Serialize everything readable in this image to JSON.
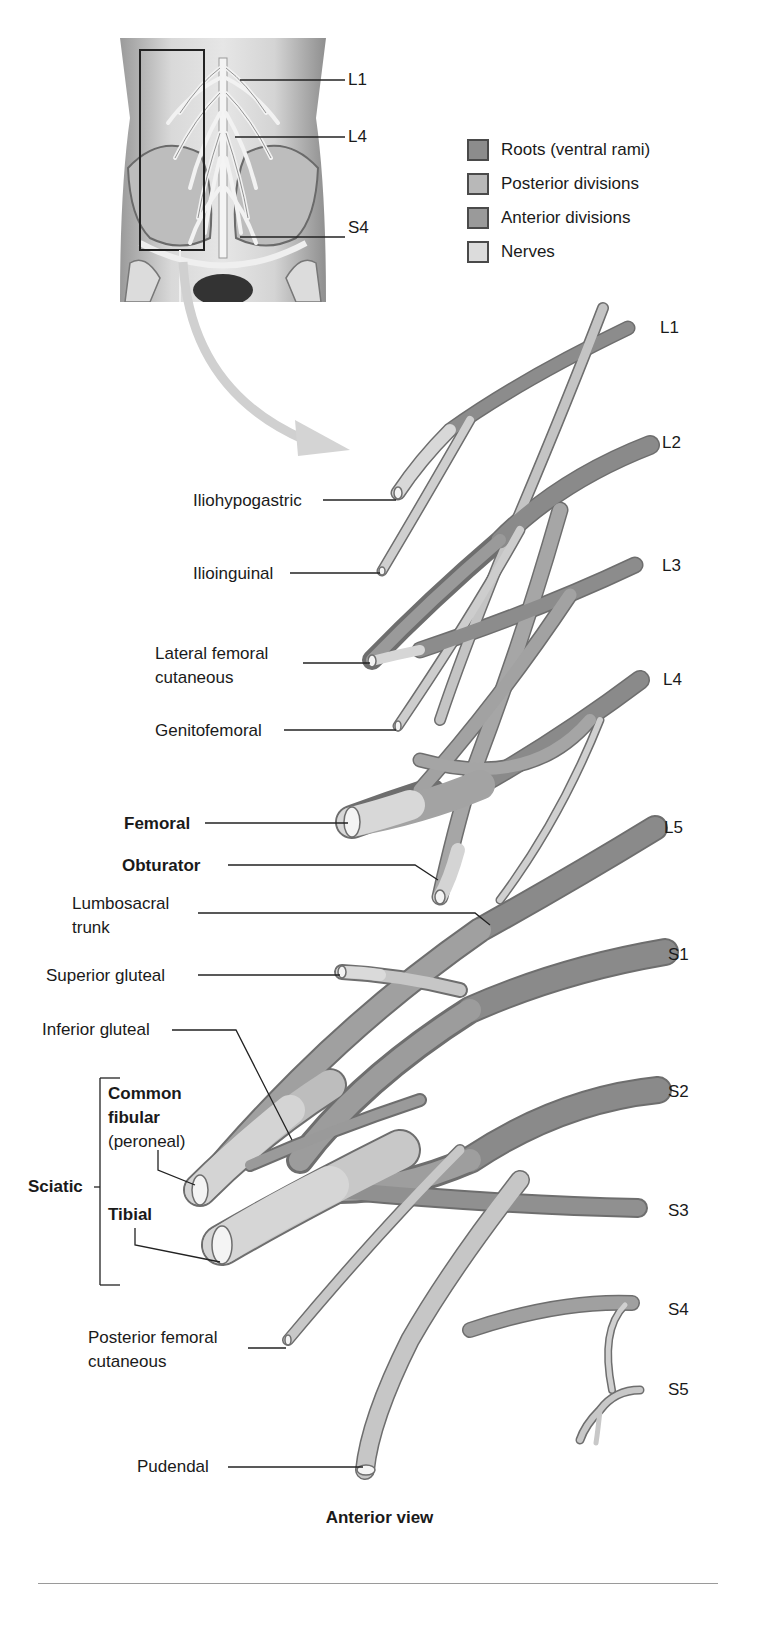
{
  "figure": {
    "caption": "Anterior view"
  },
  "legend": {
    "items": [
      {
        "label": "Roots (ventral rami)",
        "color": "#8c8c8c"
      },
      {
        "label": "Posterior divisions",
        "color": "#b8b8b8"
      },
      {
        "label": "Anterior divisions",
        "color": "#9a9a9a"
      },
      {
        "label": "Nerves",
        "color": "#dcdcdc"
      }
    ]
  },
  "inset": {
    "labels": [
      "L1",
      "L4",
      "S4"
    ]
  },
  "roots": [
    "L1",
    "L2",
    "L3",
    "L4",
    "L5",
    "S1",
    "S2",
    "S3",
    "S4",
    "S5"
  ],
  "nerves": {
    "iliohypogastric": "Iliohypogastric",
    "ilioinguinal": "Ilioinguinal",
    "lateral_femoral_cutaneous_1": "Lateral femoral",
    "lateral_femoral_cutaneous_2": "cutaneous",
    "genitofemoral": "Genitofemoral",
    "femoral": "Femoral",
    "obturator": "Obturator",
    "lumbosacral_trunk_1": "Lumbosacral",
    "lumbosacral_trunk_2": "trunk",
    "superior_gluteal": "Superior gluteal",
    "inferior_gluteal": "Inferior gluteal",
    "common_fibular_1": "Common",
    "common_fibular_2": "fibular",
    "common_fibular_3": "(peroneal)",
    "sciatic": "Sciatic",
    "tibial": "Tibial",
    "posterior_femoral_cutaneous_1": "Posterior femoral",
    "posterior_femoral_cutaneous_2": "cutaneous",
    "pudendal": "Pudendal"
  },
  "colors": {
    "root": "#8a8a8a",
    "anterior": "#9c9c9c",
    "posterior": "#b5b5b5",
    "nerve": "#d6d6d6",
    "outline": "#6e6e6e",
    "leader": "#222222"
  }
}
